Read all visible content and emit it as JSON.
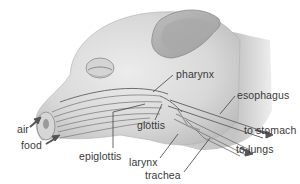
{
  "diagram": {
    "labels": {
      "pharynx": "pharynx",
      "esophagus": "esophagus",
      "glottis": "glottis",
      "to_stomach": "to stomach",
      "air": "air",
      "food": "food",
      "epiglottis": "epiglottis",
      "larynx": "larynx",
      "to_lungs": "to lungs",
      "trachea": "trachea"
    },
    "colors": {
      "skin_light": "#e4e4e4",
      "skin_mid": "#c8c8c8",
      "skin_dark": "#9a9a9a",
      "outline": "#7a7a7a",
      "arrow": "#555555",
      "label_text": "#3a3a3a",
      "leader_line": "#444444"
    }
  }
}
